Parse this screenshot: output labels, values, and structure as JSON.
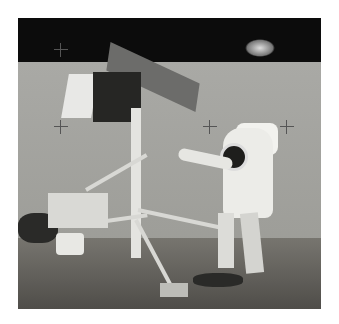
{
  "image": {
    "description": "Black-and-white photograph of an astronaut in a spacesuit beside a spindly robotic lander on a lunar surface, with a lunar module visible on the horizon",
    "subjects": [
      "astronaut",
      "robotic-lander",
      "lunar-module",
      "lunar-surface",
      "black-sky"
    ],
    "palette": {
      "sky": "#0c0c0c",
      "surface": "#a9a9a5",
      "foreground": "#5e5c58",
      "suit": "#ecece8",
      "panel_dark": "#262624"
    },
    "reticle_marks": [
      {
        "x": 43,
        "y": 32
      },
      {
        "x": 43,
        "y": 109
      },
      {
        "x": 192,
        "y": 109
      },
      {
        "x": 269,
        "y": 109
      }
    ]
  }
}
